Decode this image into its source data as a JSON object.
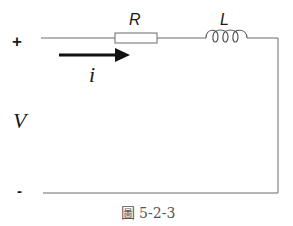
{
  "diagram": {
    "type": "RL series circuit",
    "terminals": {
      "positive_label": "+",
      "negative_label": "-"
    },
    "source": {
      "label": "V"
    },
    "components": [
      {
        "id": "resistor",
        "label": "R",
        "kind": "resistor"
      },
      {
        "id": "inductor",
        "label": "L",
        "kind": "inductor"
      }
    ],
    "current": {
      "label": "i",
      "direction": "left-to-right"
    },
    "caption": "圖 5-2-3",
    "colors": {
      "wire": "#6b6b6b",
      "arrow": "#111111",
      "text": "#1a1a1a",
      "caption": "#555555"
    }
  }
}
